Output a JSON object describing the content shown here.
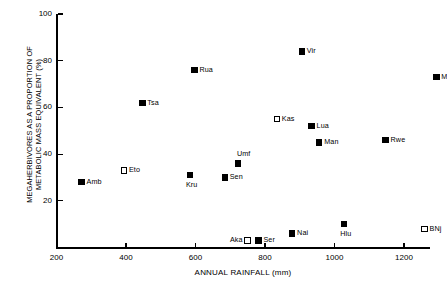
{
  "chart_data": {
    "type": "scatter",
    "title": "",
    "xlabel": "ANNUAL RAINFALL (mm)",
    "ylabel": "MEGAHERBIVORES AS A PROPORTION OF METABOLIC MASS EQUIVALENT (%)",
    "xlim": [
      200,
      1270
    ],
    "ylim": [
      0,
      100
    ],
    "xticks": [
      200,
      400,
      600,
      800,
      1000,
      1200
    ],
    "yticks": [
      20,
      40,
      60,
      80,
      100
    ],
    "grid": false,
    "legend": null,
    "marker_styles": {
      "filled": "filled black square",
      "open": "open white square with black outline"
    },
    "points": [
      {
        "label": "Amb",
        "x": 272,
        "y": 28,
        "style": "filled",
        "label_pos": "right"
      },
      {
        "label": "Eto",
        "x": 394,
        "y": 33,
        "style": "open",
        "label_pos": "right"
      },
      {
        "label": "Tsa",
        "x": 447,
        "y": 62,
        "style": "filled",
        "label_pos": "right"
      },
      {
        "label": "Kru",
        "x": 584,
        "y": 31,
        "style": "filled",
        "label_pos": "below"
      },
      {
        "label": "Rua",
        "x": 597,
        "y": 76,
        "style": "filled",
        "label_pos": "right"
      },
      {
        "label": "Sen",
        "x": 684,
        "y": 30,
        "style": "filled",
        "label_pos": "right"
      },
      {
        "label": "Umf",
        "x": 722,
        "y": 36,
        "style": "filled",
        "label_pos": "above"
      },
      {
        "label": "Aka",
        "x": 750,
        "y": 3,
        "style": "open",
        "label_pos": "left"
      },
      {
        "label": "Ser",
        "x": 781,
        "y": 3,
        "style": "filled",
        "label_pos": "right"
      },
      {
        "label": "Kas",
        "x": 834,
        "y": 55,
        "style": "open",
        "label_pos": "right"
      },
      {
        "label": "Nai",
        "x": 878,
        "y": 6,
        "style": "filled",
        "label_pos": "right"
      },
      {
        "label": "Vir",
        "x": 906,
        "y": 84,
        "style": "filled",
        "label_pos": "right"
      },
      {
        "label": "Lua",
        "x": 934,
        "y": 52,
        "style": "filled",
        "label_pos": "right"
      },
      {
        "label": "Man",
        "x": 956,
        "y": 45,
        "style": "filled",
        "label_pos": "right"
      },
      {
        "label": "Hlu",
        "x": 1028,
        "y": 10,
        "style": "filled",
        "label_pos": "below"
      },
      {
        "label": "Rwe",
        "x": 1147,
        "y": 46,
        "style": "filled",
        "label_pos": "right"
      },
      {
        "label": "BNj",
        "x": 1259,
        "y": 8,
        "style": "open",
        "label_pos": "right"
      },
      {
        "label": "M",
        "x": 1293,
        "y": 73,
        "style": "filled",
        "label_pos": "right"
      }
    ]
  }
}
